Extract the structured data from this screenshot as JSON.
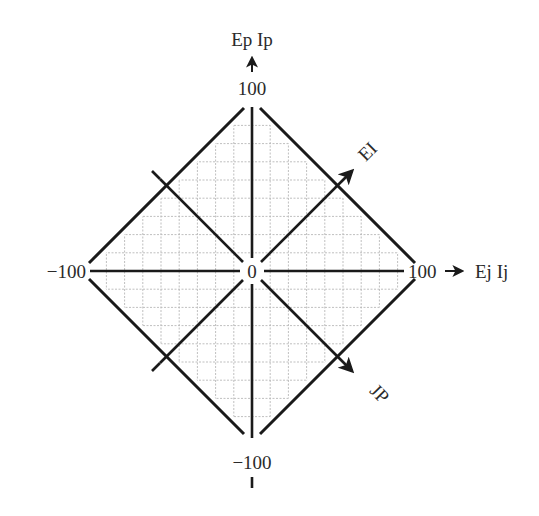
{
  "diagram": {
    "type": "rotated-square-quadrant-diagram",
    "center_label": "0",
    "axes": {
      "vertical": {
        "label": "Ep Ip",
        "max_label": "100",
        "min_label": "−100",
        "direction": "up"
      },
      "horizontal": {
        "label": "Ej Ij",
        "max_label": "100",
        "min_label": "−100",
        "direction": "right"
      },
      "diagonal_up": {
        "label": "EI",
        "direction": "up-right"
      },
      "diagonal_down": {
        "label": "JP",
        "direction": "down-right"
      }
    },
    "range": [
      -100,
      100
    ],
    "grid": {
      "visible": true,
      "style": "dotted",
      "cells_per_half_axis": 9,
      "clipped_to_diamond": true
    },
    "colors": {
      "line": "#1a1a1a",
      "grid": "#b8b8b8",
      "background": "#ffffff"
    }
  }
}
